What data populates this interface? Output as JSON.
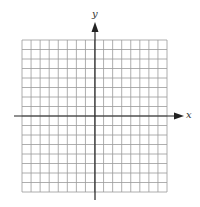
{
  "diagram": {
    "type": "coordinate-grid",
    "x_axis_label": "x",
    "y_axis_label": "y",
    "grid": {
      "columns": 16,
      "rows": 16,
      "left": 22,
      "top": 40,
      "right": 167,
      "bottom": 192
    },
    "origin": {
      "x": 95,
      "y": 116
    },
    "colors": {
      "grid": "#9a9a9a",
      "axis": "#222222",
      "background": "#ffffff"
    }
  }
}
